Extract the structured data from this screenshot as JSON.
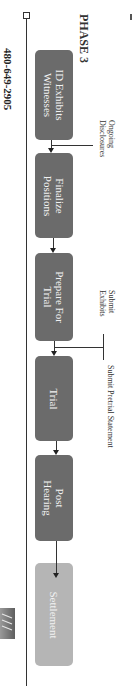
{
  "page": {
    "phone": "480-649-2905",
    "title": "PHASE 3"
  },
  "flow": {
    "steps": [
      {
        "label": "ID Exhibits\nWitnesses",
        "line1": "ID Exhibits",
        "line2": "Witnesses"
      },
      {
        "label": "Finalize Positions",
        "line1": "Finalize",
        "line2": "Positions"
      },
      {
        "label": "Prepare For Trial",
        "line1": "Prepare For",
        "line2": "Trial"
      },
      {
        "label": "Trial",
        "line1": "Trial",
        "line2": ""
      },
      {
        "label": "Post Hearing",
        "line1": "Post",
        "line2": "Hearing"
      },
      {
        "label": "Settlement",
        "line1": "Settlement",
        "line2": ""
      }
    ],
    "annotations": [
      {
        "line1": "Ongoing",
        "line2": "Disclosures"
      },
      {
        "line1": "Submit",
        "line2": "Exhibits"
      },
      {
        "line1": "Submit Pretrial Statement",
        "line2": ""
      }
    ]
  },
  "colors": {
    "step": "#6b6b6b",
    "final_step": "#b5b5b5",
    "text_on_step": "#f2f2f2",
    "line": "#333333"
  },
  "logo": {
    "icon": "law-firm-logo-icon"
  }
}
